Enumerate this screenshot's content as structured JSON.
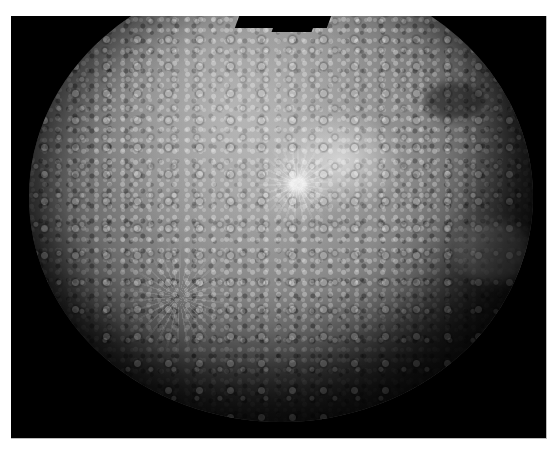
{
  "image": {
    "subject": "planet-photomosaic",
    "description": "Grayscale cratered planet (Mercury-like) hemisphere photomosaic on black background",
    "colors": {
      "page_background": "#ffffff",
      "frame_background": "#000000",
      "surface_light": "#a9a9a9",
      "surface_mid": "#6a6a6a",
      "surface_dark": "#141414"
    },
    "features": [
      {
        "name": "bright-ray-crater",
        "position": "upper-center-right"
      },
      {
        "name": "ray-crater-lower-left",
        "position": "lower-left"
      },
      {
        "name": "dark-patch",
        "position": "upper-right"
      },
      {
        "name": "smooth-plain",
        "position": "right"
      },
      {
        "name": "mosaic-gap",
        "position": "top-center"
      }
    ]
  }
}
